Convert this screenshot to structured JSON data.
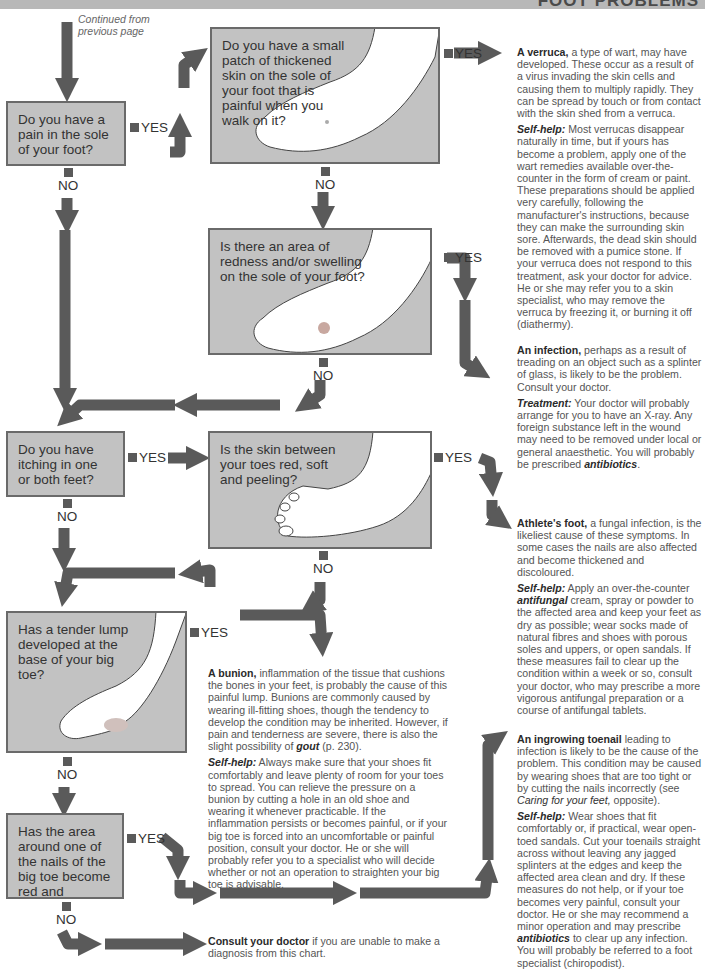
{
  "header": {
    "title": "FOOT PROBLEMS",
    "bar_color": "#b8b8b8"
  },
  "colors": {
    "arrow": "#5a5a5a",
    "question_box": "#c2c2c2",
    "box_border": "#6a6a6a"
  },
  "continued": {
    "line1": "Continued from",
    "line2": "previous page"
  },
  "labels": {
    "yes": "YES",
    "no": "NO"
  },
  "questions": [
    {
      "id": "q1",
      "text": "Do you have a pain in the sole of your foot?"
    },
    {
      "id": "q2",
      "text": "Do you have a small patch of thickened skin on the sole of your foot that is painful when you walk on it?"
    },
    {
      "id": "q3",
      "text": "Is there an area of redness and/or swelling on the sole of your foot?"
    },
    {
      "id": "q4",
      "text": "Do you have itching in one or both feet?"
    },
    {
      "id": "q5",
      "text": "Is the skin between your toes red, soft and peeling?"
    },
    {
      "id": "q6",
      "text": "Has a tender lump developed at the base of your big toe?"
    },
    {
      "id": "q7",
      "text": "Has the area around one of the nails of the big toe become red and painful?"
    }
  ],
  "outcomes": {
    "verruca": {
      "title": "A verruca,",
      "body": " a type of wart, may have developed. These occur as a result of a virus invading the skin cells and causing them to multiply rapidly. They can be spread by touch or from contact with the skin shed from a verruca.",
      "help_label": "Self-help:",
      "help": " Most verrucas disappear naturally in time, but if yours has become a problem, apply one of the wart remedies available over-the-counter in the form of cream or paint. These preparations should be applied very carefully, following the manufacturer's instructions, because they can make the surrounding skin sore. Afterwards, the dead skin should be removed with a pumice stone. If your verruca does not respond to this treatment, ask your doctor for advice. He or she may refer you to a skin specialist, who may remove the verruca by freezing it, or burning it off (diathermy)."
    },
    "infection": {
      "title": "An infection,",
      "body": " perhaps as a result of treading on an object such as a splinter of glass, is likely to be the problem. Consult your doctor.",
      "help_label": "Treatment:",
      "help": " Your doctor will probably arrange for you to have an X-ray. Any foreign substance left in the wound may need to be removed under local or general anaesthetic. You will probably be prescribed ",
      "help_em": "antibiotics",
      "help_end": "."
    },
    "athletes_foot": {
      "title": "Athlete's foot,",
      "body": " a fungal infection, is the likeliest cause of these symptoms. In some cases the nails are also affected and become thickened and discoloured.",
      "help_label": "Self-help:",
      "help_pre": " Apply an over-the-counter ",
      "help_em": "antifungal",
      "help": " cream, spray or powder to the affected area and keep your feet as dry as possible; wear socks made of natural fibres and shoes with porous soles and uppers, or open sandals. If these measures fail to clear up the condition within a week or so, consult your doctor, who may prescribe a more vigorous antifungal preparation or a course of antifungal tablets."
    },
    "bunion": {
      "title": "A bunion,",
      "body": " inflammation of the tissue that cushions the bones in your feet, is probably the cause of this painful lump. Bunions are commonly caused by wearing ill-fitting shoes, though the tendency to develop the condition may be inherited. However, if pain and tenderness are severe, there is also the slight possibility of ",
      "body_em": "gout",
      "body_end": " (p. 230).",
      "help_label": "Self-help:",
      "help": " Always make sure that your shoes fit comfortably and leave plenty of room for your toes to spread. You can relieve the pressure on a bunion by cutting a hole in an old shoe and wearing it whenever practicable. If the inflammation persists or becomes painful, or if your big toe is forced into an uncomfortable or painful position, consult your doctor. He or she will probably refer you to a specialist who will decide whether or not an operation to straighten your big toe is advisable."
    },
    "toenail": {
      "title": "An ingrowing toenail",
      "body": " leading to infection is likely to be the cause of the problem. This condition may be caused by wearing shoes that are too tight or by cutting the nails incorrectly (see ",
      "body_em": "Caring for your feet,",
      "body_end": " opposite).",
      "help_label": "Self-help:",
      "help": " Wear shoes that fit comfortably or, if practical, wear open-toed sandals. Cut your toenails straight across without leaving any jagged splinters at the edges and keep the affected area clean and dry. If these measures do not help, or if your toe becomes very painful, consult your doctor. He or she may recommend a minor operation and may prescribe ",
      "help_em": "antibiotics",
      "help_end": " to clear up any infection. You will probably be referred to a foot specialist (chiropodist)."
    },
    "consult": {
      "title": "Consult your doctor",
      "body": " if you are unable to make a diagnosis from this chart."
    }
  }
}
